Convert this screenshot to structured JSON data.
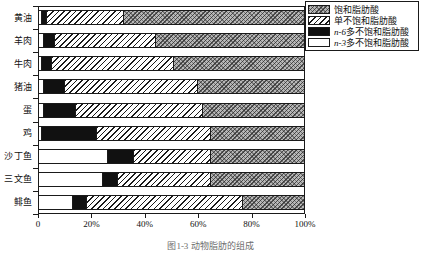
{
  "chart_data": {
    "type": "bar",
    "orientation": "horizontal",
    "stacked": true,
    "normalized": "percent",
    "title": "",
    "xlabel": "",
    "ylabel": "",
    "xlim": [
      0,
      100
    ],
    "grid": false,
    "legend_position": "top-right",
    "categories": [
      "黄油",
      "羊肉",
      "牛肉",
      "猪油",
      "蛋",
      "鸡",
      "沙丁鱼",
      "三文鱼",
      "鲱鱼"
    ],
    "xticks": [
      0,
      20,
      40,
      60,
      80,
      100
    ],
    "xticklabels": [
      "0",
      "20%",
      "40%",
      "60%",
      "80%",
      "100%"
    ],
    "series": [
      {
        "name": "n-3多不饱和脂肪酸",
        "key": "n3",
        "pattern": "solid-white",
        "values": [
          1,
          2,
          1,
          2,
          2,
          1,
          26,
          24,
          13
        ]
      },
      {
        "name": "n-6多不饱和脂肪酸",
        "key": "n6",
        "pattern": "solid-black",
        "values": [
          2,
          4,
          4,
          8,
          12,
          21,
          10,
          6,
          5
        ]
      },
      {
        "name": "单不饱和脂肪酸",
        "key": "mono",
        "pattern": "diagonal-hatch",
        "values": [
          29,
          38,
          46,
          50,
          48,
          43,
          29,
          35,
          59
        ]
      },
      {
        "name": "饱和脂肪酸",
        "key": "sat",
        "pattern": "gray-crosshatch",
        "values": [
          68,
          56,
          49,
          40,
          38,
          35,
          35,
          35,
          23
        ]
      }
    ]
  },
  "legend": {
    "items": [
      {
        "label": "饱和脂肪酸",
        "prefix": "",
        "swatch": "gray-crosshatch"
      },
      {
        "label": "单不饱和脂肪酸",
        "prefix": "",
        "swatch": "diagonal-hatch"
      },
      {
        "label": "多不饱和脂肪酸",
        "prefix": "n-6",
        "swatch": "solid-black"
      },
      {
        "label": "多不饱和脂肪酸",
        "prefix": "n-3",
        "swatch": "solid-white"
      }
    ]
  },
  "caption": {
    "text": "图1-3  动物脂肪的组成"
  },
  "colors": {
    "saturated": "#b7b7b7",
    "monounsaturated": "#ffffff",
    "n6": "#111111",
    "n3": "#ffffff",
    "axis": "#1a1a1a",
    "caption": "#6e6e6e"
  }
}
